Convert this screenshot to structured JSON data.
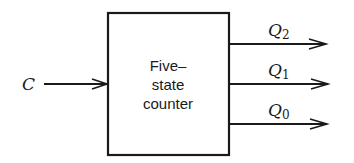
{
  "diagram": {
    "block": {
      "lines": [
        "Five–",
        "state",
        "counter"
      ]
    },
    "input": {
      "label": "C"
    },
    "outputs": [
      {
        "label": "Q",
        "subscript": "2"
      },
      {
        "label": "Q",
        "subscript": "1"
      },
      {
        "label": "Q",
        "subscript": "0"
      }
    ]
  }
}
